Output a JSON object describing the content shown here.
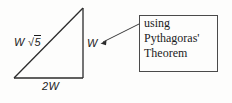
{
  "diagram": {
    "background_color": "#fdfdfc",
    "stroke_color": "#2b2b2b",
    "triangle": {
      "vertices": {
        "apex": [
          83,
          8
        ],
        "bottom_left": [
          14,
          78
        ],
        "bottom_right": [
          83,
          78
        ]
      },
      "labels": {
        "hypotenuse_coefficient": "W",
        "hypotenuse_radical_sign": "√",
        "hypotenuse_radicand": "5",
        "vertical_side": "W",
        "base_side": "2W"
      }
    },
    "callout": {
      "border_color": "#4a4a4a",
      "lines": [
        "using",
        "Pythagoras'",
        "Theorem"
      ],
      "leader_line": {
        "from": [
          139,
          24
        ],
        "to": [
          101,
          43
        ],
        "arrow": "left-arrowhead"
      }
    }
  }
}
